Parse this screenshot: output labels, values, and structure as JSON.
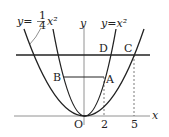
{
  "diagram": {
    "curves": [
      {
        "label_lhs": "y=",
        "label_num": "1",
        "label_den": "4",
        "label_rhs": "x²",
        "name": "y = 1/4 x^2"
      },
      {
        "label": "y=x²",
        "name": "y = x^2"
      }
    ],
    "axes": {
      "x_label": "x",
      "y_label": "y",
      "origin_label": "O"
    },
    "points": {
      "A": "A",
      "B": "B",
      "C": "C",
      "D": "D"
    },
    "ticks": {
      "x1": "2",
      "x2": "5"
    }
  }
}
